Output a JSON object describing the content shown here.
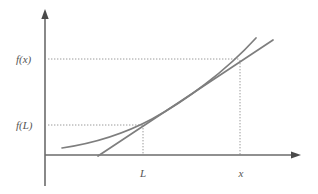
{
  "figure": {
    "type": "math-diagram",
    "background_color": "#ffffff",
    "stroke_color": "#808080",
    "axis_color": "#666666",
    "dotted_color": "#999999",
    "text_color": "#555555",
    "width": 318,
    "height": 194
  },
  "axes": {
    "origin": {
      "x": 45,
      "y": 155
    },
    "y_axis": {
      "x": 45,
      "top_y": 10,
      "bottom_y": 186,
      "arrow": "up"
    },
    "x_axis": {
      "y": 155,
      "left_x": 45,
      "right_x": 300,
      "arrow": "right"
    }
  },
  "labels": {
    "y_upper": "f(x)",
    "y_lower": "f(L)",
    "x_left": "L",
    "x_right": "x"
  },
  "label_positions": {
    "y_upper": {
      "x": 16,
      "y": 62
    },
    "y_lower": {
      "x": 16,
      "y": 129
    },
    "x_left": {
      "x": 139,
      "y": 175
    },
    "x_right": {
      "x": 237,
      "y": 175
    }
  },
  "points": {
    "L": {
      "x": 143,
      "y": 125
    },
    "x": {
      "x": 240,
      "y": 60
    }
  },
  "guides": {
    "horizontal_fx": {
      "x1": 48,
      "x2": 240,
      "y": 59
    },
    "horizontal_fL": {
      "x1": 48,
      "x2": 143,
      "y": 125
    },
    "vertical_L": {
      "x": 143,
      "y1": 125,
      "y2": 155
    },
    "vertical_x": {
      "x": 240,
      "y1": 60,
      "y2": 155
    }
  },
  "curves": {
    "convex_curve": {
      "name": "function-curve",
      "path": "M 62,148 C 96,143 124,134 152,119 C 185,101 225,72 256,38"
    },
    "chord_line": {
      "name": "chord-line",
      "x1": 98,
      "y1": 156,
      "x2": 273,
      "y2": 40
    }
  },
  "arrowheads": {
    "y_axis_tip": {
      "x": 45,
      "y": 10
    },
    "x_axis_tip": {
      "x": 300,
      "y": 155
    }
  }
}
